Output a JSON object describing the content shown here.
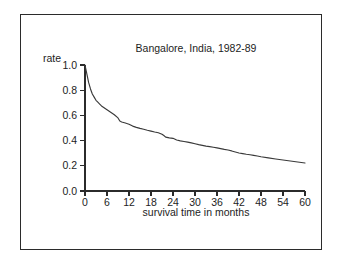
{
  "figure": {
    "background_color": "#ffffff",
    "frame_color": "#2b2b2b",
    "line_color": "#3a3a3a"
  },
  "chart_data": {
    "type": "line",
    "title": "Bangalore, India, 1982-89",
    "xlabel": "survival time in months",
    "ylabel": "rate",
    "xlim": [
      0,
      60
    ],
    "ylim": [
      0.0,
      1.0
    ],
    "grid": false,
    "legend": null,
    "xticks": [
      0,
      6,
      12,
      18,
      24,
      30,
      36,
      42,
      48,
      54,
      60
    ],
    "xtick_labels": [
      "0",
      "6",
      "12",
      "18",
      "24",
      "30",
      "36",
      "42",
      "48",
      "54",
      "60"
    ],
    "yticks": [
      0.0,
      0.2,
      0.4,
      0.6,
      0.8,
      1.0
    ],
    "ytick_labels": [
      "0.0",
      "0.2",
      "0.4",
      "0.6",
      "0.8",
      "1.0"
    ],
    "series": [
      {
        "name": "survival rate",
        "x": [
          0,
          0.5,
          1,
          1.5,
          2,
          2.5,
          3,
          3.5,
          4,
          4.5,
          5,
          5.5,
          6,
          7,
          8,
          9,
          9.5,
          10,
          11,
          12,
          13,
          14,
          15,
          16,
          17,
          18,
          19,
          20,
          21,
          21.5,
          22,
          23,
          24,
          25,
          26,
          27,
          28,
          29,
          30,
          31,
          32,
          33,
          34,
          35,
          36,
          37,
          38,
          39,
          40,
          41,
          42,
          43,
          44,
          45,
          46,
          47,
          48,
          50,
          52,
          54,
          56,
          58,
          60
        ],
        "values": [
          1.0,
          0.93,
          0.86,
          0.81,
          0.77,
          0.745,
          0.72,
          0.705,
          0.69,
          0.675,
          0.665,
          0.655,
          0.645,
          0.625,
          0.605,
          0.58,
          0.555,
          0.548,
          0.54,
          0.53,
          0.515,
          0.505,
          0.497,
          0.49,
          0.482,
          0.475,
          0.468,
          0.462,
          0.45,
          0.44,
          0.428,
          0.422,
          0.418,
          0.405,
          0.398,
          0.393,
          0.388,
          0.382,
          0.375,
          0.368,
          0.362,
          0.356,
          0.352,
          0.347,
          0.342,
          0.336,
          0.33,
          0.325,
          0.318,
          0.31,
          0.302,
          0.297,
          0.292,
          0.288,
          0.283,
          0.278,
          0.272,
          0.263,
          0.254,
          0.246,
          0.238,
          0.23,
          0.222
        ]
      }
    ]
  }
}
